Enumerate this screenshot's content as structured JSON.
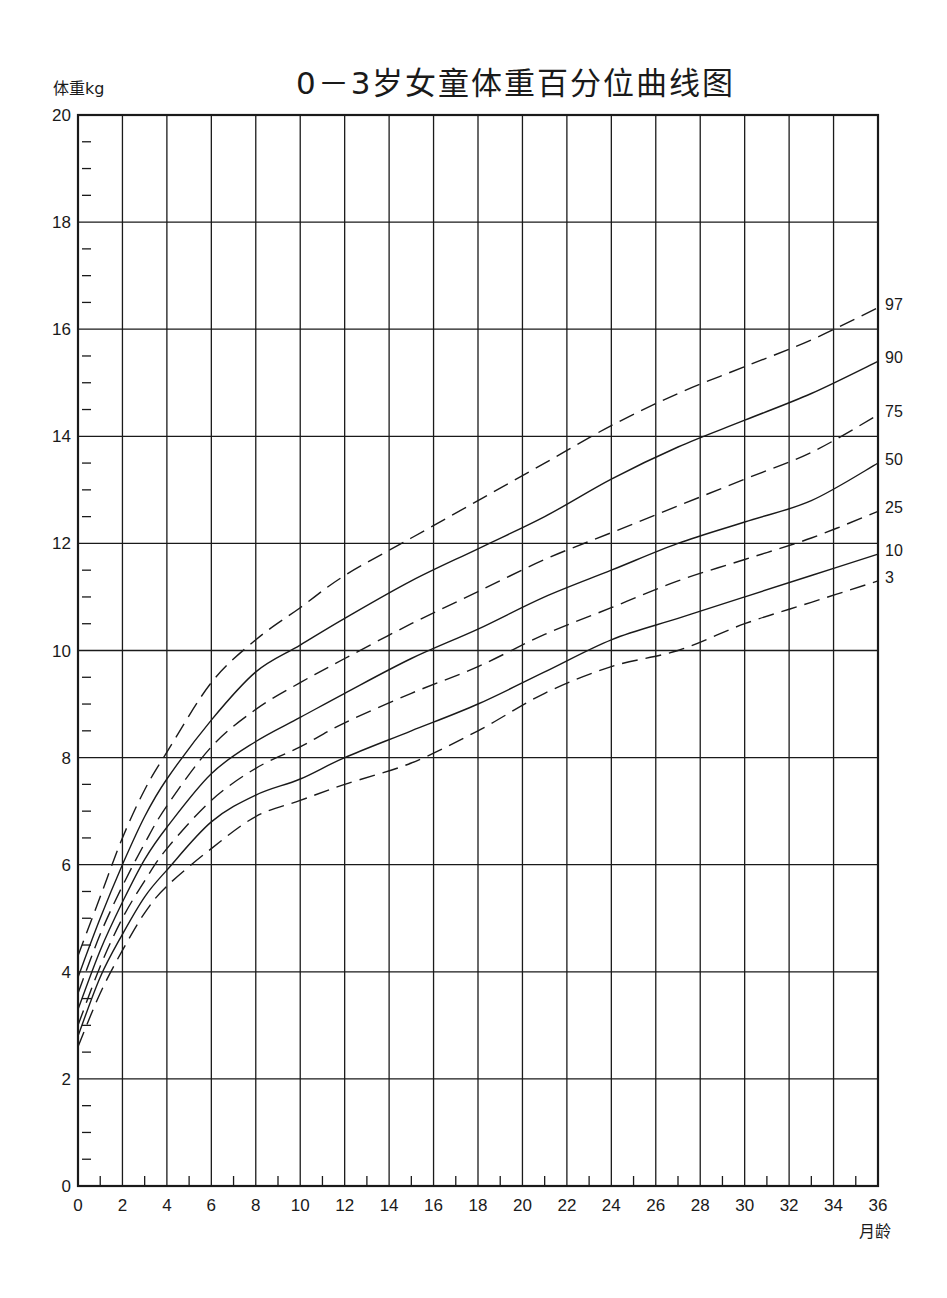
{
  "title": "0－3岁女童体重百分位曲线图",
  "y_axis_label": "体重kg",
  "x_axis_label": "月龄",
  "colors": {
    "line": "#1a1a1a",
    "background": "#ffffff"
  },
  "chart_data": {
    "type": "line",
    "title": "0－3岁女童体重百分位曲线图",
    "xlabel": "月龄",
    "ylabel": "体重kg",
    "xlim": [
      0,
      36
    ],
    "ylim": [
      0,
      20
    ],
    "grid": true,
    "x_ticks": [
      0,
      2,
      4,
      6,
      8,
      10,
      12,
      14,
      16,
      18,
      20,
      22,
      24,
      26,
      28,
      30,
      32,
      34,
      36
    ],
    "x_minor_ticks": [
      1,
      3,
      5,
      7,
      9,
      11,
      13,
      15,
      17,
      19,
      21,
      23,
      25,
      27,
      29,
      31,
      33,
      35
    ],
    "y_ticks": [
      0,
      2,
      4,
      6,
      8,
      10,
      12,
      14,
      16,
      18,
      20
    ],
    "legend_position": "right-end labels",
    "x": [
      0,
      1,
      2,
      3,
      4,
      6,
      8,
      10,
      12,
      15,
      18,
      21,
      24,
      27,
      30,
      33,
      36
    ],
    "series": [
      {
        "name": "97",
        "style": "dashed",
        "values": [
          4.3,
          5.4,
          6.5,
          7.4,
          8.1,
          9.4,
          10.2,
          10.8,
          11.4,
          12.1,
          12.8,
          13.5,
          14.2,
          14.8,
          15.3,
          15.8,
          16.4
        ]
      },
      {
        "name": "90",
        "style": "solid",
        "values": [
          3.9,
          5.0,
          6.0,
          6.9,
          7.6,
          8.7,
          9.6,
          10.1,
          10.6,
          11.3,
          11.9,
          12.5,
          13.2,
          13.8,
          14.3,
          14.8,
          15.4
        ]
      },
      {
        "name": "75",
        "style": "dashed",
        "values": [
          3.6,
          4.7,
          5.6,
          6.4,
          7.1,
          8.2,
          8.9,
          9.4,
          9.85,
          10.5,
          11.1,
          11.7,
          12.2,
          12.7,
          13.2,
          13.7,
          14.4
        ]
      },
      {
        "name": "50",
        "style": "solid",
        "values": [
          3.3,
          4.4,
          5.3,
          6.1,
          6.7,
          7.7,
          8.3,
          8.75,
          9.2,
          9.85,
          10.4,
          11.0,
          11.5,
          12.0,
          12.4,
          12.8,
          13.5
        ]
      },
      {
        "name": "25",
        "style": "dashed",
        "values": [
          3.0,
          4.1,
          5.0,
          5.7,
          6.3,
          7.2,
          7.8,
          8.2,
          8.65,
          9.2,
          9.7,
          10.3,
          10.8,
          11.3,
          11.7,
          12.1,
          12.6
        ]
      },
      {
        "name": "10",
        "style": "solid",
        "values": [
          2.8,
          3.9,
          4.7,
          5.4,
          5.9,
          6.8,
          7.3,
          7.6,
          8.0,
          8.5,
          9.0,
          9.6,
          10.2,
          10.6,
          11.0,
          11.4,
          11.8
        ]
      },
      {
        "name": "3",
        "style": "dashed",
        "values": [
          2.6,
          3.6,
          4.4,
          5.1,
          5.6,
          6.3,
          6.9,
          7.2,
          7.5,
          7.9,
          8.5,
          9.2,
          9.7,
          10.0,
          10.5,
          10.9,
          11.3
        ]
      }
    ]
  }
}
